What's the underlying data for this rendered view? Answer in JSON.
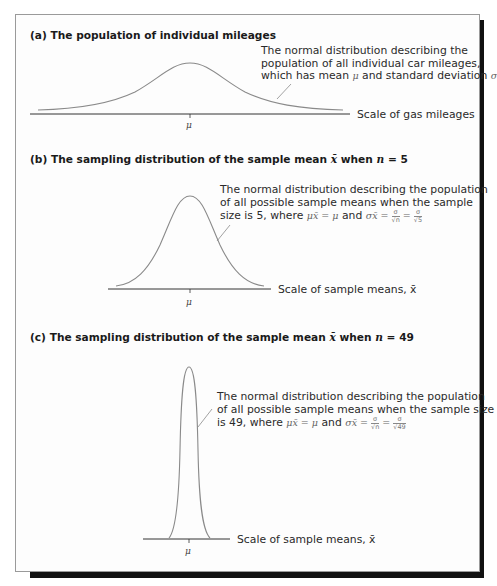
{
  "figure": {
    "panels": [
      {
        "heading": "(a) The population of individual mileages",
        "annotation_lines": [
          "The normal distribution describing the",
          "population of all individual car mileages,",
          "which has mean μ and standard deviation σ"
        ],
        "annotation_parts": {
          "line3_prefix": "which has mean ",
          "mu": "μ",
          "line3_mid": " and standard deviation ",
          "sigma": "σ"
        },
        "axis_label": "Scale of gas mileages",
        "center_label": "μ"
      },
      {
        "heading_prefix": "(b) The sampling distribution of the sample mean ",
        "heading_xbar": "x̄",
        "heading_mid": " when ",
        "heading_n": "n",
        "heading_suffix": " = 5",
        "annotation_lines": [
          "The normal distribution describing the population",
          "of all possible sample means when the sample",
          "size is 5, where"
        ],
        "formula": {
          "mu_xbar": "μx̄",
          "eq1": " = ",
          "mu": "μ",
          "and": " and ",
          "sigma_xbar": "σx̄",
          "eq2": " = ",
          "frac1_num": "σ",
          "frac1_den": "√n",
          "eq3": " = ",
          "frac2_num": "σ",
          "frac2_den": "√5"
        },
        "axis_label": "Scale of sample means, x̄",
        "center_label": "μ"
      },
      {
        "heading_prefix": "(c) The sampling distribution of the sample mean ",
        "heading_xbar": "x̄",
        "heading_mid": " when ",
        "heading_n": "n",
        "heading_suffix": " = 49",
        "annotation_lines": [
          "The normal distribution describing the population",
          "of all possible sample means when the sample size",
          "is 49, where"
        ],
        "formula": {
          "mu_xbar": "μx̄",
          "eq1": " = ",
          "mu": "μ",
          "and": " and ",
          "sigma_xbar": "σx̄",
          "eq2": " = ",
          "frac1_num": "σ",
          "frac1_den": "√n",
          "eq3": " = ",
          "frac2_num": "σ",
          "frac2_den": "√49"
        },
        "axis_label": "Scale of sample means, x̄",
        "center_label": "μ"
      }
    ],
    "colors": {
      "curve": "#8a8a8a",
      "axis": "#333333",
      "shadow": "#111111",
      "frame_border": "#9a9a9a"
    }
  }
}
